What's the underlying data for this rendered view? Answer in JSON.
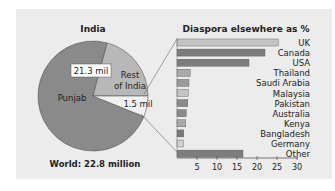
{
  "chart_data": [
    {
      "type": "pie",
      "title": "India",
      "footer": "World: 22.8 million",
      "slices": [
        {
          "label": "Punjab",
          "color": "#8a8a8a"
        },
        {
          "label": "Rest of India",
          "color": "#b8b8b8"
        },
        {
          "label": "1.5 mil",
          "color": "#f2f2f2"
        }
      ],
      "annotations": [
        "21.3 mil",
        "1.5 mil"
      ]
    },
    {
      "type": "bar",
      "orientation": "horizontal",
      "title": "Diaspora elsewhere as %",
      "categories": [
        "UK",
        "Canada",
        "USA",
        "Thailand",
        "Saudi Arabia",
        "Malaysia",
        "Pakistan",
        "Australia",
        "Kenya",
        "Bangladesh",
        "Germany",
        "Other"
      ],
      "values": [
        25.3,
        22,
        18,
        3.3,
        3,
        2.8,
        2.7,
        2.3,
        2.2,
        1.7,
        1.6,
        16.5
      ],
      "xlabel": "",
      "ylabel": "",
      "xlim": [
        0,
        30
      ],
      "xticks": [
        5,
        10,
        15,
        20,
        25,
        30
      ],
      "grid": false
    }
  ],
  "pie": {
    "title": "India",
    "footer": "World: 22.8 million",
    "label_punjab": "Punjab",
    "label_rest_line1": "Rest",
    "label_rest_line2": "of India",
    "label_big": "21.3 mil",
    "label_small": "1.5 mil"
  },
  "bars": {
    "title": "Diaspora elsewhere as %",
    "items": [
      {
        "label": "UK",
        "value": 25.3,
        "color": "#c4c4c4"
      },
      {
        "label": "Canada",
        "value": 22,
        "color": "#7d7d7d"
      },
      {
        "label": "USA",
        "value": 18,
        "color": "#7d7d7d"
      },
      {
        "label": "Thailand",
        "value": 3.3,
        "color": "#a9a9a9"
      },
      {
        "label": "Saudi Arabia",
        "value": 3,
        "color": "#9a9a9a"
      },
      {
        "label": "Malaysia",
        "value": 2.8,
        "color": "#c4c4c4"
      },
      {
        "label": "Pakistan",
        "value": 2.7,
        "color": "#8a8a8a"
      },
      {
        "label": "Australia",
        "value": 2.3,
        "color": "#8a8a8a"
      },
      {
        "label": "Kenya",
        "value": 2.2,
        "color": "#a9a9a9"
      },
      {
        "label": "Bangladesh",
        "value": 1.7,
        "color": "#7a7a7a"
      },
      {
        "label": "Germany",
        "value": 1.6,
        "color": "#d0d0d0"
      },
      {
        "label": "Other",
        "value": 16.5,
        "color": "#7d7d7d"
      }
    ],
    "ticks": [
      "5",
      "10",
      "15",
      "20",
      "25",
      "30"
    ]
  }
}
